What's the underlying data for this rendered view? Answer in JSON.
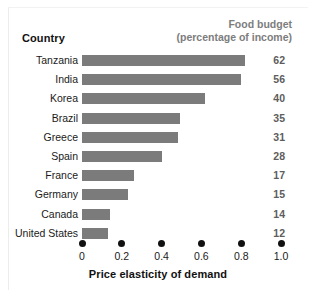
{
  "headers": {
    "country": "Country",
    "budget_line1": "Food budget",
    "budget_line2": "(percentage of income)"
  },
  "axis": {
    "title": "Price elasticity of demand",
    "ticks": [
      "0",
      "0.2",
      "0.4",
      "0.6",
      "0.8",
      "1.0"
    ]
  },
  "colors": {
    "bar": "#7b7b7b",
    "value_text": "#5d5d5d",
    "header_text": "#7d7d7d",
    "label_text": "#1a1a1a",
    "background": "#ffffff"
  },
  "chart_data": {
    "type": "bar",
    "orientation": "horizontal",
    "title": "",
    "xlabel": "Price elasticity of demand",
    "ylabel": "Country",
    "xlim": [
      0,
      1.0
    ],
    "xticks": [
      0,
      0.2,
      0.4,
      0.6,
      0.8,
      1.0
    ],
    "grid": false,
    "legend": "none",
    "categories": [
      "Tanzania",
      "India",
      "Korea",
      "Brazil",
      "Greece",
      "Spain",
      "France",
      "Germany",
      "Canada",
      "United States"
    ],
    "values": [
      0.82,
      0.8,
      0.62,
      0.49,
      0.48,
      0.4,
      0.26,
      0.23,
      0.14,
      0.13
    ],
    "series": [
      {
        "name": "Price elasticity of demand",
        "values": [
          0.82,
          0.8,
          0.62,
          0.49,
          0.48,
          0.4,
          0.26,
          0.23,
          0.14,
          0.13
        ]
      },
      {
        "name": "Food budget (percentage of income)",
        "values": [
          62,
          56,
          40,
          35,
          31,
          28,
          17,
          15,
          14,
          12
        ]
      }
    ]
  },
  "rows": [
    {
      "country": "Tanzania",
      "elasticity": 0.82,
      "budget": "62"
    },
    {
      "country": "India",
      "elasticity": 0.8,
      "budget": "56"
    },
    {
      "country": "Korea",
      "elasticity": 0.62,
      "budget": "40"
    },
    {
      "country": "Brazil",
      "elasticity": 0.49,
      "budget": "35"
    },
    {
      "country": "Greece",
      "elasticity": 0.48,
      "budget": "31"
    },
    {
      "country": "Spain",
      "elasticity": 0.4,
      "budget": "28"
    },
    {
      "country": "France",
      "elasticity": 0.26,
      "budget": "17"
    },
    {
      "country": "Germany",
      "elasticity": 0.23,
      "budget": "15"
    },
    {
      "country": "Canada",
      "elasticity": 0.14,
      "budget": "14"
    },
    {
      "country": "United States",
      "elasticity": 0.13,
      "budget": "12"
    }
  ]
}
